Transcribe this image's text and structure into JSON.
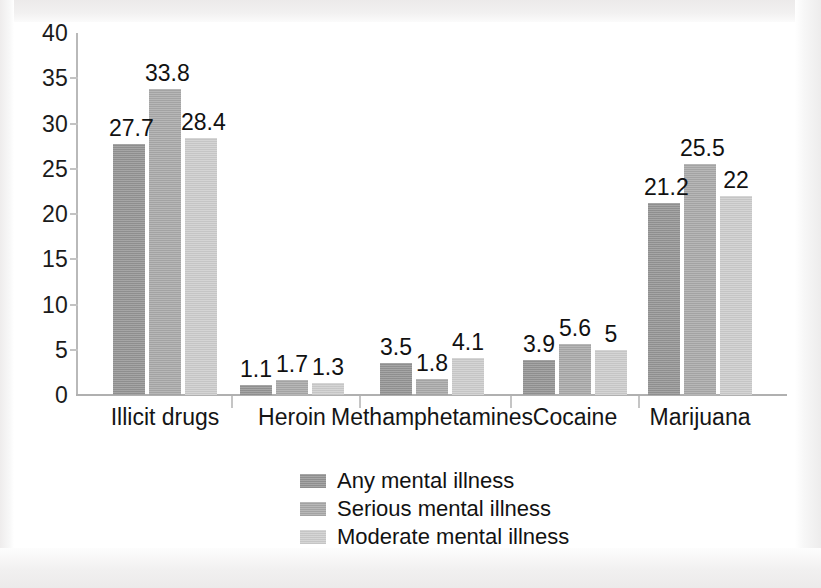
{
  "chart_data": {
    "type": "bar",
    "title": "",
    "subtitle": "",
    "xlabel": "",
    "ylabel": "",
    "categories": [
      "Illicit drugs",
      "Heroin",
      "Methamphetamines",
      "Cocaine",
      "Marijuana"
    ],
    "series": [
      {
        "name": "Any mental illness",
        "color": "#949494",
        "values": [
          27.7,
          1.1,
          3.5,
          3.9,
          21.2
        ],
        "labels": [
          "27.7",
          "1.1",
          "3.5",
          "3.9",
          "21.2"
        ]
      },
      {
        "name": "Serious mental illness",
        "color": "#a9a9a9",
        "values": [
          33.8,
          1.7,
          1.8,
          5.6,
          25.5
        ],
        "labels": [
          "33.8",
          "1.7",
          "1.8",
          "5.6",
          "25.5"
        ]
      },
      {
        "name": "Moderate mental illness",
        "color": "#cdcdcd",
        "values": [
          28.4,
          1.3,
          4.1,
          5.0,
          22.0
        ],
        "labels": [
          "28.4",
          "1.3",
          "4.1",
          "5",
          "22"
        ]
      }
    ],
    "ylim": [
      0,
      40
    ],
    "yticks": [
      0,
      5,
      10,
      15,
      20,
      25,
      30,
      35,
      40
    ],
    "ytick_labels": [
      "0",
      "5",
      "10",
      "15",
      "20",
      "25",
      "30",
      "35",
      "40"
    ],
    "grid": false,
    "legend_position": "bottom-center",
    "axis_color": "#b9b9b9",
    "label_color": "#111111"
  },
  "legend": {
    "entries": [
      {
        "label": "Any mental illness",
        "color": "#949494"
      },
      {
        "label": "Serious mental illness",
        "color": "#a9a9a9"
      },
      {
        "label": "Moderate mental illness",
        "color": "#cdcdcd"
      }
    ]
  }
}
